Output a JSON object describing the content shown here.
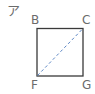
{
  "figure": {
    "figure_label": "ア",
    "vertices": {
      "top_left": "B",
      "top_right": "C",
      "bottom_left": "F",
      "bottom_right": "G"
    },
    "diagonal": {
      "from": "F",
      "to": "C",
      "style": "dashed"
    },
    "colors": {
      "square_stroke": "#3a3a3a",
      "diagonal_stroke": "#5b86c4",
      "label_color": "#6b6b6b"
    }
  }
}
